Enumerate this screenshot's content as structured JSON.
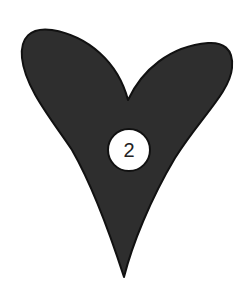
{
  "figure": {
    "shape": "heart-icon",
    "fill_color": "#2e2e2e",
    "stroke_color": "#111111",
    "background_color": "#ffffff"
  },
  "badge": {
    "label": "2",
    "fill_color": "#ffffff",
    "stroke_color": "#111111"
  }
}
